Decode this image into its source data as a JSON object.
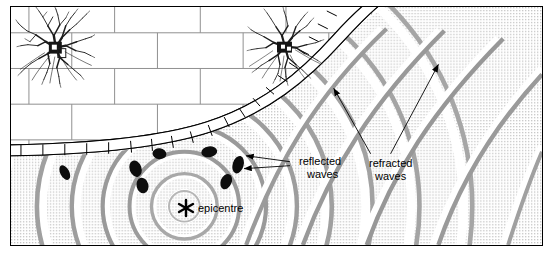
{
  "figure": {
    "width": 553,
    "height": 257
  },
  "labels": {
    "epicentre": "epicentre",
    "reflected_line1": "reflected",
    "reflected_line2": "waves",
    "refracted_line1": "refracted",
    "refracted_line2": "waves"
  },
  "markers": {
    "epicentre_icon": "asterisk-star",
    "epicentre_x": 184,
    "epicentre_y": 207
  },
  "colors": {
    "background": "#ffffff",
    "border": "#000000",
    "brick_line": "#8a8a8a",
    "stipple": "#c9c9c9",
    "wave_band": "#9a9a9a",
    "wave_band_dark": "#6e6e6e",
    "reflected_blob": "#111111",
    "arrow": "#000000",
    "tree": "#1a1a1a"
  },
  "regions": {
    "upper_material": "brick-masonry",
    "lower_material": "stippled-ground",
    "boundary": "segmented-curved-interface"
  },
  "trees": [
    {
      "name": "tree-left",
      "cx": 55,
      "cy": 47,
      "r": 40
    },
    {
      "name": "tree-right",
      "cx": 285,
      "cy": 46,
      "r": 38
    }
  ],
  "waves": {
    "source": "epicentre",
    "ring_count": 9,
    "reflected_blob_count": 7
  }
}
